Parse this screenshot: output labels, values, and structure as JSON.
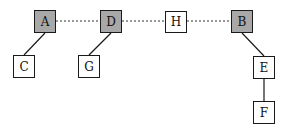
{
  "diagram": {
    "nodes": [
      {
        "id": "A",
        "label": "A",
        "shaded": true,
        "x": 34,
        "y": 10,
        "w": 22,
        "h": 23
      },
      {
        "id": "D",
        "label": "D",
        "shaded": true,
        "x": 100,
        "y": 10,
        "w": 22,
        "h": 23
      },
      {
        "id": "H",
        "label": "H",
        "shaded": false,
        "x": 165,
        "y": 11,
        "w": 22,
        "h": 22
      },
      {
        "id": "B",
        "label": "B",
        "shaded": true,
        "x": 231,
        "y": 10,
        "w": 22,
        "h": 23
      },
      {
        "id": "C",
        "label": "C",
        "shaded": false,
        "x": 13,
        "y": 55,
        "w": 22,
        "h": 23
      },
      {
        "id": "G",
        "label": "G",
        "shaded": false,
        "x": 78,
        "y": 55,
        "w": 22,
        "h": 23
      },
      {
        "id": "E",
        "label": "E",
        "shaded": false,
        "x": 253,
        "y": 56,
        "w": 22,
        "h": 23
      },
      {
        "id": "F",
        "label": "F",
        "shaded": false,
        "x": 253,
        "y": 101,
        "w": 22,
        "h": 23
      }
    ],
    "edges": [
      {
        "from": "A",
        "to": "D",
        "style": "dotted"
      },
      {
        "from": "D",
        "to": "H",
        "style": "dotted"
      },
      {
        "from": "H",
        "to": "B",
        "style": "dotted"
      },
      {
        "from": "A",
        "to": "C",
        "style": "solid"
      },
      {
        "from": "D",
        "to": "G",
        "style": "solid"
      },
      {
        "from": "B",
        "to": "E",
        "style": "solid"
      },
      {
        "from": "E",
        "to": "F",
        "style": "solid"
      }
    ],
    "colors": {
      "shaded_fill": "#a8a8a8",
      "plain_fill": "#ffffff",
      "stroke": "#1a1a1a"
    }
  }
}
